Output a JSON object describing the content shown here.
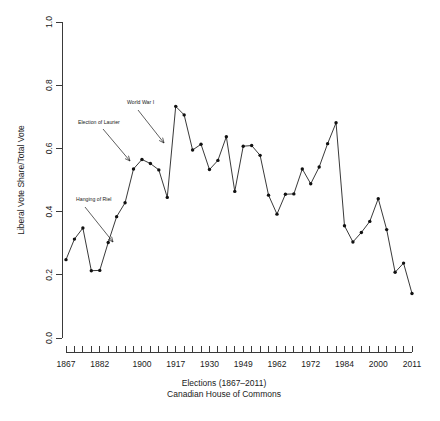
{
  "figure": {
    "background": "#ffffff",
    "ink_color": "#1a1a1a",
    "series_color": "#111111"
  },
  "chart_data": {
    "type": "line",
    "title": "",
    "xlabel": "Elections (1867–2011)",
    "xlabel_line2": "Canadian House of Commons",
    "ylabel": "Liberal Vote Share/Total Vote",
    "ylim": [
      0.0,
      1.0
    ],
    "ytick_labels": [
      "0.0",
      "0.2",
      "0.4",
      "0.6",
      "0.8",
      "1.0"
    ],
    "ytick_values": [
      0.0,
      0.2,
      0.4,
      0.6,
      0.8,
      1.0
    ],
    "xtick_labels": [
      "1867",
      "1882",
      "1900",
      "1917",
      "1930",
      "1949",
      "1962",
      "1972",
      "1984",
      "2000",
      "2011"
    ],
    "xtick_label_index": [
      0,
      4,
      9,
      13,
      17,
      21,
      25,
      29,
      33,
      37,
      41
    ],
    "n_ticks": 42,
    "grid": false,
    "legend": null,
    "marker": "filled-circle",
    "x": [
      1867,
      1872,
      1874,
      1878,
      1882,
      1887,
      1891,
      1896,
      1900,
      1904,
      1908,
      1911,
      1917,
      1921,
      1925,
      1926,
      1930,
      1935,
      1940,
      1945,
      1949,
      1953,
      1957,
      1958,
      1962,
      1963,
      1965,
      1968,
      1972,
      1974,
      1979,
      1980,
      1984,
      1988,
      1993,
      1997,
      2000,
      2004,
      2006,
      2008,
      2011
    ],
    "values": [
      0.248,
      0.313,
      0.348,
      0.213,
      0.214,
      0.302,
      0.384,
      0.428,
      0.535,
      0.565,
      0.552,
      0.532,
      0.445,
      0.733,
      0.706,
      0.595,
      0.613,
      0.533,
      0.562,
      0.637,
      0.464,
      0.607,
      0.609,
      0.578,
      0.452,
      0.392,
      0.455,
      0.456,
      0.535,
      0.488,
      0.541,
      0.615,
      0.681,
      0.355,
      0.304,
      0.334,
      0.369,
      0.441,
      0.343,
      0.208,
      0.237
    ],
    "last_value": 0.141,
    "annotations": [
      {
        "label": "Hanging of Riel",
        "text_x": 76,
        "text_y": 201,
        "arrow_from_x": 85,
        "arrow_from_y": 207,
        "arrow_to_x": 113,
        "arrow_to_y": 242
      },
      {
        "label": "Election of Laurier",
        "text_x": 78,
        "text_y": 124,
        "arrow_from_x": 103,
        "arrow_from_y": 129,
        "arrow_to_x": 130,
        "arrow_to_y": 161
      },
      {
        "label": "World War I",
        "text_x": 127,
        "text_y": 104,
        "arrow_from_x": 138,
        "arrow_from_y": 110,
        "arrow_to_x": 164,
        "arrow_to_y": 143
      }
    ]
  }
}
